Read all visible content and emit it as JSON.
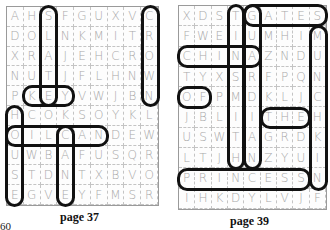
{
  "left_puzzle": {
    "caption": "page 37",
    "rows": [
      [
        "A",
        "H",
        "S",
        "F",
        "G",
        "U",
        "X",
        "V",
        "C"
      ],
      [
        "D",
        "O",
        "L",
        "N",
        "K",
        "M",
        "I",
        "T",
        "R"
      ],
      [
        "X",
        "R",
        "A",
        "J",
        "E",
        "H",
        "C",
        "R",
        "O"
      ],
      [
        "N",
        "U",
        "T",
        "J",
        "F",
        "L",
        "H",
        "N",
        "W"
      ],
      [
        "P",
        "K",
        "E",
        "Y",
        "V",
        "W",
        "J",
        "B",
        "N"
      ],
      [
        "H",
        "C",
        "O",
        "K",
        "S",
        "O",
        "Y",
        "K",
        "L"
      ],
      [
        "O",
        "I",
        "L",
        "C",
        "A",
        "N",
        "D",
        "E",
        "W"
      ],
      [
        "U",
        "W",
        "B",
        "A",
        "F",
        "U",
        "S",
        "Q",
        "R"
      ],
      [
        "S",
        "T",
        "D",
        "N",
        "T",
        "X",
        "B",
        "V",
        "O"
      ],
      [
        "E",
        "G",
        "V",
        "E",
        "Y",
        "F",
        "M",
        "S",
        "R"
      ]
    ],
    "found_words": [
      {
        "word": "SLATE",
        "direction": "vertical",
        "row": 0,
        "col": 2,
        "length": 5
      },
      {
        "word": "CROWN",
        "direction": "vertical",
        "row": 0,
        "col": 8,
        "length": 5
      },
      {
        "word": "KEY",
        "direction": "horizontal",
        "row": 4,
        "col": 1,
        "length": 3
      },
      {
        "word": "HOUSE",
        "direction": "vertical",
        "row": 5,
        "col": 0,
        "length": 5
      },
      {
        "word": "OILCAN",
        "direction": "horizontal",
        "row": 6,
        "col": 0,
        "length": 6
      },
      {
        "word": "CANE",
        "direction": "vertical",
        "row": 6,
        "col": 3,
        "length": 4
      }
    ]
  },
  "right_puzzle": {
    "caption": "page 39",
    "rows": [
      [
        "X",
        "D",
        "S",
        "T",
        "G",
        "A",
        "T",
        "E",
        "S"
      ],
      [
        "F",
        "W",
        "E",
        "I",
        "U",
        "M",
        "H",
        "I",
        "M"
      ],
      [
        "C",
        "H",
        "I",
        "N",
        "A",
        "Z",
        "N",
        "D",
        "U"
      ],
      [
        "T",
        "Y",
        "X",
        "S",
        "R",
        "F",
        "P",
        "Q",
        "N"
      ],
      [
        "O",
        "F",
        "P",
        "M",
        "D",
        "K",
        "L",
        "J",
        "C"
      ],
      [
        "J",
        "B",
        "L",
        "I",
        "I",
        "T",
        "H",
        "E",
        "H"
      ],
      [
        "U",
        "S",
        "W",
        "T",
        "A",
        "G",
        "R",
        "D",
        "K"
      ],
      [
        "L",
        "T",
        "J",
        "H",
        "N",
        "Z",
        "Y",
        "U",
        "I"
      ],
      [
        "P",
        "R",
        "I",
        "N",
        "C",
        "E",
        "S",
        "S",
        "N"
      ],
      [
        "I",
        "H",
        "K",
        "D",
        "Y",
        "L",
        "V",
        "J",
        "F"
      ]
    ],
    "found_words": [
      {
        "word": "TINSMITH",
        "direction": "vertical",
        "row": 0,
        "col": 3,
        "length": 8
      },
      {
        "word": "GUARDIAN",
        "direction": "vertical",
        "row": 0,
        "col": 4,
        "length": 8
      },
      {
        "word": "GATES",
        "direction": "horizontal",
        "row": 0,
        "col": 4,
        "length": 5
      },
      {
        "word": "MUNCHKIN",
        "direction": "vertical",
        "row": 1,
        "col": 8,
        "length": 8
      },
      {
        "word": "CHINA",
        "direction": "horizontal",
        "row": 2,
        "col": 0,
        "length": 5
      },
      {
        "word": "OF",
        "direction": "horizontal",
        "row": 4,
        "col": 0,
        "length": 2
      },
      {
        "word": "THE",
        "direction": "horizontal",
        "row": 5,
        "col": 5,
        "length": 3
      },
      {
        "word": "PRINCESS",
        "direction": "horizontal",
        "row": 8,
        "col": 0,
        "length": 8
      }
    ]
  },
  "page_number": "60",
  "colors": {
    "loop": "#111111",
    "letter": "#a9a9a9",
    "gridline": "#c4c4c4"
  }
}
